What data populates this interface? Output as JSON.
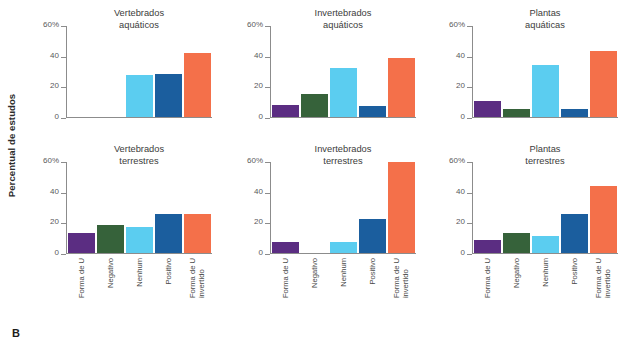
{
  "figure": {
    "panel_letter": "B",
    "ylabel": "Percentual de estudos"
  },
  "chart_data": {
    "type": "bar",
    "title": "",
    "xlabel": "",
    "ylabel": "Percentual de estudos",
    "ylim": [
      0,
      60
    ],
    "yticks": [
      0,
      20,
      40,
      60
    ],
    "ytick_labels": [
      "0",
      "20",
      "40",
      "60%"
    ],
    "grid": false,
    "legend": "none",
    "categories": [
      "Forma de U",
      "Negativo",
      "Nenhum",
      "Positivo",
      "Forma de U invertido"
    ],
    "category_lines": [
      [
        "Forma de U"
      ],
      [
        "Negativo"
      ],
      [
        "Nenhum"
      ],
      [
        "Positivo"
      ],
      [
        "Forma de U",
        "invertido"
      ]
    ],
    "category_colors": [
      "#5b2d82",
      "#36623a",
      "#5bcdf0",
      "#1b5e9e",
      "#f4704a"
    ],
    "panels": [
      {
        "title_lines": [
          "Vertebrados",
          "aquáticos"
        ],
        "title": "Vertebrados aquáticos",
        "values": [
          0,
          0,
          28,
          28.5,
          42.5
        ]
      },
      {
        "title_lines": [
          "Invertebrados",
          "aquáticos"
        ],
        "title": "Invertebrados aquáticos",
        "values": [
          8,
          15,
          32,
          7,
          39
        ]
      },
      {
        "title_lines": [
          "Plantas",
          "aquáticas"
        ],
        "title": "Plantas aquáticas",
        "values": [
          10.5,
          5.5,
          34,
          5.5,
          43.5
        ]
      },
      {
        "title_lines": [
          "Vertebrados",
          "terrestres"
        ],
        "title": "Vertebrados terrestres",
        "values": [
          13.5,
          18.5,
          17,
          25.5,
          25.5
        ]
      },
      {
        "title_lines": [
          "Invertebrados",
          "terrestres"
        ],
        "title": "Invertebrados terrestres",
        "values": [
          7,
          0,
          7,
          22.5,
          60
        ]
      },
      {
        "title_lines": [
          "Plantas",
          "terrestres"
        ],
        "title": "Plantas terrestres",
        "values": [
          8.5,
          13.5,
          11,
          25.5,
          44.5
        ]
      }
    ]
  }
}
